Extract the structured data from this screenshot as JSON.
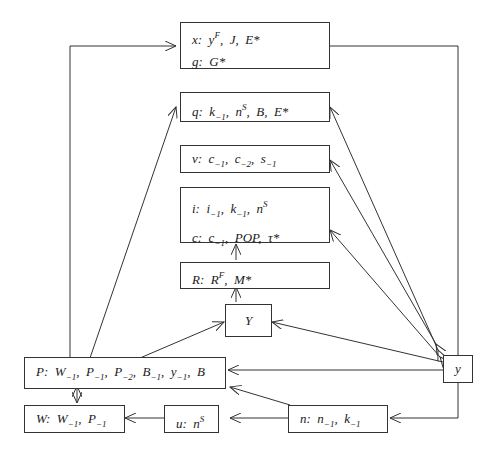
{
  "diagram": {
    "nodes": {
      "x_g": {
        "rows": [
          {
            "label": "x:",
            "terms": [
              "y^F",
              "J",
              "E*"
            ]
          },
          {
            "label": "g:",
            "terms": [
              "G*"
            ]
          }
        ]
      },
      "q": {
        "rows": [
          {
            "label": "q:",
            "terms": [
              "k_-1",
              "n^S",
              "B",
              "E*"
            ]
          }
        ]
      },
      "v": {
        "rows": [
          {
            "label": "v:",
            "terms": [
              "c_-1",
              "c_-2",
              "s_-1"
            ]
          }
        ]
      },
      "i_c": {
        "rows": [
          {
            "label": "i:",
            "terms": [
              "i_-1",
              "k_-1",
              "n^S"
            ]
          },
          {
            "label": "c:",
            "terms": [
              "c_-1",
              "POP",
              "τ*"
            ]
          }
        ]
      },
      "R": {
        "rows": [
          {
            "label": "R:",
            "terms": [
              "R^F",
              "M*"
            ]
          }
        ]
      },
      "Y": {
        "label": "Y"
      },
      "y": {
        "label": "y"
      },
      "P": {
        "rows": [
          {
            "label": "P:",
            "terms": [
              "W_-1",
              "P_-1",
              "P_-2",
              "B_-1",
              "y_-1",
              "B"
            ]
          }
        ]
      },
      "W": {
        "rows": [
          {
            "label": "W:",
            "terms": [
              "W_-1",
              "P_-1"
            ]
          }
        ]
      },
      "u": {
        "rows": [
          {
            "label": "u:",
            "terms": [
              "n^S"
            ]
          }
        ]
      },
      "n": {
        "rows": [
          {
            "label": "n:",
            "terms": [
              "n_-1",
              "k_-1"
            ]
          }
        ]
      }
    },
    "edges": [
      {
        "from": "P",
        "to": "x_g",
        "type": "arrow"
      },
      {
        "from": "P",
        "to": "q",
        "type": "arrow"
      },
      {
        "from": "P",
        "to": "Y",
        "type": "arrow"
      },
      {
        "from": "P",
        "to": "W",
        "type": "double-arrow"
      },
      {
        "from": "x_g",
        "to": "y",
        "type": "line"
      },
      {
        "from": "y",
        "to": "q",
        "type": "double-arrow"
      },
      {
        "from": "y",
        "to": "v",
        "type": "double-arrow"
      },
      {
        "from": "y",
        "to": "i_c",
        "type": "double-arrow"
      },
      {
        "from": "y",
        "to": "Y",
        "type": "arrow"
      },
      {
        "from": "y",
        "to": "P",
        "type": "arrow"
      },
      {
        "from": "y",
        "to": "n",
        "type": "arrow"
      },
      {
        "from": "n",
        "to": "u",
        "type": "arrow"
      },
      {
        "from": "n",
        "to": "P",
        "type": "arrow"
      },
      {
        "from": "u",
        "to": "W",
        "type": "arrow"
      },
      {
        "from": "R",
        "to": "i_c",
        "type": "arrow"
      },
      {
        "from": "Y",
        "to": "R",
        "type": "arrow"
      }
    ]
  },
  "text": {
    "x_lbl": "x:",
    "x_t1": "y",
    "x_t1s": "F",
    "x_t2": "J",
    "x_t3": "E*",
    "g_lbl": "g:",
    "g_t1": "G*",
    "q_lbl": "q:",
    "q_t1": "k",
    "q_t1s": "−1",
    "q_t2": "n",
    "q_t2s": "S",
    "q_t3": "B",
    "q_t4": "E*",
    "v_lbl": "v:",
    "v_t1": "c",
    "v_t1s": "−1",
    "v_t2": "c",
    "v_t2s": "−2",
    "v_t3": "s",
    "v_t3s": "−1",
    "i_lbl": "i:",
    "i_t1": "i",
    "i_t1s": "−1",
    "i_t2": "k",
    "i_t2s": "−1",
    "i_t3": "n",
    "i_t3s": "S",
    "c_lbl": "c:",
    "c_t1": "c",
    "c_t1s": "−1",
    "c_t2": "POP",
    "c_t3": "τ*",
    "R_lbl": "R:",
    "R_t1": "R",
    "R_t1s": "F",
    "R_t2": "M*",
    "Y": "Y",
    "y": "y",
    "P_lbl": "P:",
    "P_t1": "W",
    "P_t1s": "−1",
    "P_t2": "P",
    "P_t2s": "−1",
    "P_t3": "P",
    "P_t3s": "−2",
    "P_t4": "B",
    "P_t4s": "−1",
    "P_t5": "y",
    "P_t5s": "−1",
    "P_t6": "B",
    "W_lbl": "W:",
    "W_t1": "W",
    "W_t1s": "−1",
    "W_t2": "P",
    "W_t2s": "−1",
    "u_lbl": "u:",
    "u_t1": "n",
    "u_t1s": "S",
    "n_lbl": "n:",
    "n_t1": "n",
    "n_t1s": "−1",
    "n_t2": "k",
    "n_t2s": "−1",
    "sep": ","
  },
  "colors": {
    "line": "#333333",
    "background": "#ffffff"
  }
}
